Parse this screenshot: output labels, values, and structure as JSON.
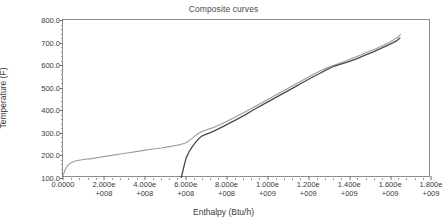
{
  "chart_data": {
    "type": "line",
    "title": "Composite curves",
    "xlabel": "Enthalpy (Btu/h)",
    "ylabel": "Temperature (F)",
    "xlim": [
      0,
      1800000000
    ],
    "ylim": [
      100,
      800
    ],
    "grid": false,
    "legend": "none",
    "xticks": [
      {
        "value": 0,
        "line1": "0.0000",
        "line2": ""
      },
      {
        "value": 200000000,
        "line1": "2.000e",
        "line2": "+008"
      },
      {
        "value": 400000000,
        "line1": "4.000e",
        "line2": "+008"
      },
      {
        "value": 600000000,
        "line1": "6.000e",
        "line2": "+008"
      },
      {
        "value": 800000000,
        "line1": "8.000e",
        "line2": "+008"
      },
      {
        "value": 1000000000,
        "line1": "1.000e",
        "line2": "+009"
      },
      {
        "value": 1200000000,
        "line1": "1.200e",
        "line2": "+009"
      },
      {
        "value": 1400000000,
        "line1": "1.400e",
        "line2": "+009"
      },
      {
        "value": 1600000000,
        "line1": "1.600e",
        "line2": "+009"
      },
      {
        "value": 1800000000,
        "line1": "1.800e",
        "line2": "+009"
      }
    ],
    "yticks": [
      {
        "value": 100,
        "label": "100.0"
      },
      {
        "value": 200,
        "label": "200.0"
      },
      {
        "value": 300,
        "label": "300.0"
      },
      {
        "value": 400,
        "label": "400.0"
      },
      {
        "value": 500,
        "label": "500.0"
      },
      {
        "value": 600,
        "label": "600.0"
      },
      {
        "value": 700,
        "label": "700.0"
      },
      {
        "value": 800,
        "label": "800.0"
      }
    ],
    "series": [
      {
        "name": "hot composite curve",
        "color": "#9a9a9a",
        "width": 1.1,
        "points": [
          [
            0,
            110
          ],
          [
            12000000,
            140
          ],
          [
            25000000,
            158
          ],
          [
            40000000,
            168
          ],
          [
            60000000,
            175
          ],
          [
            85000000,
            180
          ],
          [
            110000000,
            183
          ],
          [
            140000000,
            186
          ],
          [
            180000000,
            192
          ],
          [
            230000000,
            199
          ],
          [
            280000000,
            206
          ],
          [
            330000000,
            213
          ],
          [
            380000000,
            220
          ],
          [
            430000000,
            227
          ],
          [
            480000000,
            233
          ],
          [
            520000000,
            239
          ],
          [
            550000000,
            244
          ],
          [
            575000000,
            248
          ],
          [
            600000000,
            255
          ],
          [
            620000000,
            268
          ],
          [
            640000000,
            282
          ],
          [
            660000000,
            296
          ],
          [
            680000000,
            306
          ],
          [
            700000000,
            313
          ],
          [
            730000000,
            322
          ],
          [
            770000000,
            337
          ],
          [
            810000000,
            355
          ],
          [
            850000000,
            374
          ],
          [
            890000000,
            392
          ],
          [
            930000000,
            412
          ],
          [
            970000000,
            432
          ],
          [
            1010000000,
            452
          ],
          [
            1050000000,
            472
          ],
          [
            1090000000,
            492
          ],
          [
            1130000000,
            512
          ],
          [
            1170000000,
            532
          ],
          [
            1210000000,
            552
          ],
          [
            1250000000,
            571
          ],
          [
            1290000000,
            588
          ],
          [
            1330000000,
            601
          ],
          [
            1370000000,
            614
          ],
          [
            1410000000,
            628
          ],
          [
            1450000000,
            643
          ],
          [
            1490000000,
            658
          ],
          [
            1530000000,
            673
          ],
          [
            1570000000,
            689
          ],
          [
            1600000000,
            703
          ],
          [
            1620000000,
            714
          ],
          [
            1640000000,
            726
          ],
          [
            1650000000,
            735
          ]
        ]
      },
      {
        "name": "cold composite curve",
        "color": "#4a4a4a",
        "width": 1.3,
        "points": [
          [
            578000000,
            100
          ],
          [
            586000000,
            130
          ],
          [
            594000000,
            160
          ],
          [
            602000000,
            188
          ],
          [
            615000000,
            213
          ],
          [
            630000000,
            236
          ],
          [
            648000000,
            258
          ],
          [
            665000000,
            275
          ],
          [
            680000000,
            286
          ],
          [
            695000000,
            292
          ],
          [
            715000000,
            299
          ],
          [
            740000000,
            309
          ],
          [
            775000000,
            324
          ],
          [
            815000000,
            343
          ],
          [
            855000000,
            362
          ],
          [
            895000000,
            382
          ],
          [
            920000000,
            396
          ],
          [
            945000000,
            409
          ],
          [
            975000000,
            424
          ],
          [
            1015000000,
            444
          ],
          [
            1055000000,
            464
          ],
          [
            1095000000,
            484
          ],
          [
            1135000000,
            504
          ],
          [
            1175000000,
            524
          ],
          [
            1215000000,
            544
          ],
          [
            1255000000,
            563
          ],
          [
            1290000000,
            580
          ],
          [
            1320000000,
            593
          ],
          [
            1355000000,
            603
          ],
          [
            1395000000,
            614
          ],
          [
            1435000000,
            628
          ],
          [
            1475000000,
            643
          ],
          [
            1515000000,
            658
          ],
          [
            1555000000,
            674
          ],
          [
            1590000000,
            689
          ],
          [
            1615000000,
            700
          ],
          [
            1635000000,
            710
          ],
          [
            1648000000,
            720
          ]
        ]
      }
    ]
  }
}
